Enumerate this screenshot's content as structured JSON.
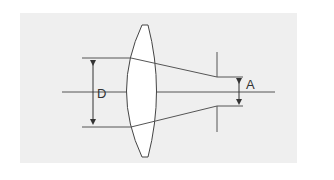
{
  "diagram": {
    "type": "lens-ray-diagram",
    "colors": {
      "background": "#ffffff",
      "panel": "#efefef",
      "line": "#555555",
      "lens_fill": "#ffffff"
    },
    "labels": {
      "aperture": "D",
      "spot": "A"
    },
    "elements": [
      "optical-axis",
      "convex-lens",
      "incoming-ray-top",
      "incoming-ray-bottom",
      "image-plane",
      "aperture-dimension-D",
      "spot-dimension-A"
    ]
  }
}
